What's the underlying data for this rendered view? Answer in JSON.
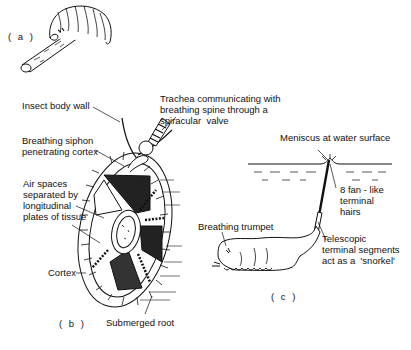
{
  "figure": {
    "panels": [
      {
        "id": "a",
        "label": "( a )"
      },
      {
        "id": "b",
        "label": "( b )"
      },
      {
        "id": "c",
        "label": "( c )"
      }
    ],
    "labels": {
      "insect_body_wall": "Insect body wall",
      "trachea": "Trachea communicating with\nbreathing spine through a\nspiracular  valve",
      "breathing_siphon": "Breathing siphon\npenetrating cortex",
      "air_spaces": "Air spaces\nseparated by\nlongitudinal\nplates of tissue",
      "cortex": "Cortex",
      "submerged_root": "Submerged root",
      "meniscus": "Meniscus at water surface",
      "fan_hairs": "8 fan - like\nterminal\nhairs",
      "breathing_trumpet": "Breathing trumpet",
      "telescopic": "Telescopic\nterminal segments\nact as a  'snorkel'"
    },
    "colors": {
      "ink": "#111111",
      "background": "#ffffff"
    }
  }
}
